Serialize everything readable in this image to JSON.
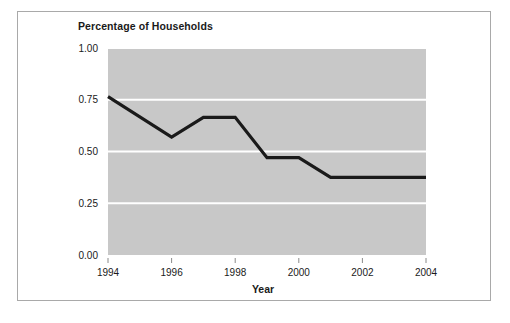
{
  "chart_data": {
    "type": "line",
    "title": "Percentage of Households",
    "xlabel": "Year",
    "ylabel": "",
    "xlim": [
      1994,
      2004
    ],
    "ylim": [
      0.0,
      1.0
    ],
    "grid": true,
    "legend": "none",
    "plot_background_color": "#c8c8c8",
    "gridline_color": "#ffffff",
    "line_color": "#1a1a1a",
    "x": [
      1994,
      1996,
      1997,
      1998,
      1999,
      2000,
      2001,
      2004
    ],
    "values": [
      0.765,
      0.57,
      0.665,
      0.665,
      0.47,
      0.47,
      0.375,
      0.375
    ],
    "xticks": [
      "1994",
      "1996",
      "1998",
      "2000",
      "2002",
      "2004"
    ],
    "xtick_values": [
      1994,
      1996,
      1998,
      2000,
      2002,
      2004
    ],
    "yticks": [
      "0.00",
      "0.25",
      "0.50",
      "0.75",
      "1.00"
    ],
    "ytick_values": [
      0.0,
      0.25,
      0.5,
      0.75,
      1.0
    ]
  }
}
